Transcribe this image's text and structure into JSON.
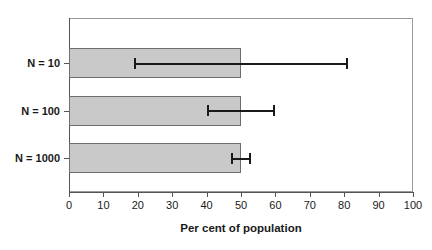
{
  "chart_data": {
    "type": "bar",
    "orientation": "horizontal",
    "title": "",
    "xlabel": "Per cent of population",
    "ylabel": "",
    "categories": [
      "N = 10",
      "N = 100",
      "N = 1000"
    ],
    "values": [
      50,
      50,
      50
    ],
    "error_bars": [
      {
        "category": "N = 10",
        "low": 19,
        "high": 81
      },
      {
        "category": "N = 100",
        "low": 40,
        "high": 60
      },
      {
        "category": "N = 1000",
        "low": 47,
        "high": 53
      }
    ],
    "xlim": [
      0,
      100
    ],
    "xticks": [
      0,
      10,
      20,
      30,
      40,
      50,
      60,
      70,
      80,
      90,
      100
    ],
    "xticklabels": [
      "0",
      "10",
      "20",
      "30",
      "40",
      "50",
      "60",
      "70",
      "80",
      "90",
      "100"
    ],
    "grid": false,
    "legend": null,
    "colors": {
      "bar_fill": "#c9c9c9",
      "bar_edge": "#6e6e6e",
      "error_bar": "#1a1a1a",
      "axis": "#555555",
      "plot_border": "#9a9a9a",
      "text": "#1a1a1a",
      "background": "#ffffff"
    }
  }
}
